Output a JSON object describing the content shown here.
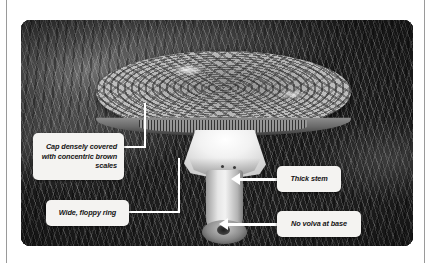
{
  "page": {
    "background_color": "#ffffff",
    "margin_rule_color": "#9a9a9a"
  },
  "figure": {
    "treatment": "grayscale",
    "callout_box_color": "#f4f3f1",
    "callout_text_color": "#141414",
    "leader_line_color": "#ffffff",
    "annotations": [
      {
        "id": "cap",
        "name": "cap-annotation",
        "text": "Cap densely covered with concentric brown scales",
        "align": "right",
        "connector": "elbow-line"
      },
      {
        "id": "ring",
        "name": "ring-annotation",
        "text": "Wide, floppy ring",
        "align": "center",
        "connector": "elbow-line"
      },
      {
        "id": "stem",
        "name": "stem-annotation",
        "text": "Thick stem",
        "align": "center",
        "connector": "arrow-left"
      },
      {
        "id": "volva",
        "name": "volva-annotation",
        "text": "No volva at base",
        "align": "center",
        "connector": "arrow-left"
      }
    ]
  }
}
